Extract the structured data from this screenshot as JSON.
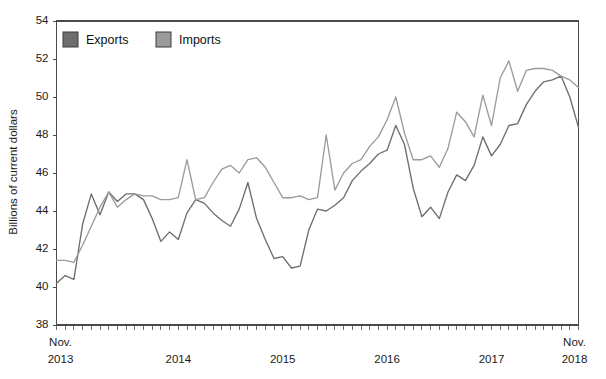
{
  "chart_data": {
    "type": "line",
    "title": "",
    "xlabel": "",
    "ylabel": "Billions of current dollars",
    "ylim": [
      38,
      54
    ],
    "ytick_step": 2,
    "yticks": [
      38,
      40,
      42,
      44,
      46,
      48,
      50,
      52,
      54
    ],
    "grid": false,
    "legend_position": "top-left",
    "x_start_label": "Nov.",
    "x_start_year": "2013",
    "x_end_label": "Nov.",
    "x_end_year": "2018",
    "x_year_labels": [
      "2014",
      "2015",
      "2016",
      "2017"
    ],
    "x_year_positions": [
      14,
      26,
      38,
      50
    ],
    "x_tick_count": 61,
    "x": [
      "Nov. 2013",
      "Dec. 2013",
      "Jan. 2014",
      "Feb. 2014",
      "Mar. 2014",
      "Apr. 2014",
      "May 2014",
      "Jun. 2014",
      "Jul. 2014",
      "Aug. 2014",
      "Sep. 2014",
      "Oct. 2014",
      "Nov. 2014",
      "Dec. 2014",
      "Jan. 2015",
      "Feb. 2015",
      "Mar. 2015",
      "Apr. 2015",
      "May 2015",
      "Jun. 2015",
      "Jul. 2015",
      "Aug. 2015",
      "Sep. 2015",
      "Oct. 2015",
      "Nov. 2015",
      "Dec. 2015",
      "Jan. 2016",
      "Feb. 2016",
      "Mar. 2016",
      "Apr. 2016",
      "May 2016",
      "Jun. 2016",
      "Jul. 2016",
      "Aug. 2016",
      "Sep. 2016",
      "Oct. 2016",
      "Nov. 2016",
      "Dec. 2016",
      "Jan. 2017",
      "Feb. 2017",
      "Mar. 2017",
      "Apr. 2017",
      "May 2017",
      "Jun. 2017",
      "Jul. 2017",
      "Aug. 2017",
      "Sep. 2017",
      "Oct. 2017",
      "Nov. 2017",
      "Dec. 2017",
      "Jan. 2018",
      "Feb. 2018",
      "Mar. 2018",
      "Apr. 2018",
      "May 2018",
      "Jun. 2018",
      "Jul. 2018",
      "Aug. 2018",
      "Sep. 2018",
      "Oct. 2018",
      "Nov. 2018"
    ],
    "series": [
      {
        "name": "Exports",
        "color": "#6e6e6e",
        "legend_swatch_color": "#6e6e6e",
        "values": [
          40.2,
          40.6,
          40.4,
          43.3,
          44.9,
          43.8,
          45.0,
          44.5,
          44.9,
          44.9,
          44.6,
          43.6,
          42.4,
          42.9,
          42.5,
          43.9,
          44.6,
          44.4,
          43.9,
          43.5,
          43.2,
          44.1,
          45.5,
          43.6,
          42.5,
          41.5,
          41.6,
          41.0,
          41.1,
          43.0,
          44.1,
          44.0,
          44.3,
          44.7,
          45.6,
          46.1,
          46.5,
          47.0,
          47.2,
          48.5,
          47.5,
          45.2,
          43.7,
          44.2,
          43.6,
          45.0,
          45.9,
          45.6,
          46.4,
          47.9,
          46.9,
          47.5,
          48.5,
          48.6,
          49.6,
          50.3,
          50.8,
          50.9,
          51.1,
          50.0,
          48.4
        ]
      },
      {
        "name": "Imports",
        "color": "#9b9b9b",
        "legend_swatch_color": "#9b9b9b",
        "values": [
          41.4,
          41.4,
          41.3,
          42.2,
          43.2,
          44.2,
          45.0,
          44.2,
          44.6,
          44.9,
          44.8,
          44.8,
          44.6,
          44.6,
          44.7,
          46.7,
          44.6,
          44.7,
          45.5,
          46.2,
          46.4,
          46.0,
          46.7,
          46.8,
          46.3,
          45.5,
          44.7,
          44.7,
          44.8,
          44.6,
          44.7,
          48.0,
          45.1,
          46.0,
          46.5,
          46.7,
          47.4,
          47.9,
          48.8,
          50.0,
          48.1,
          46.7,
          46.7,
          46.9,
          46.3,
          47.3,
          49.2,
          48.7,
          47.9,
          50.1,
          48.5,
          51.0,
          51.9,
          50.3,
          51.4,
          51.5,
          51.5,
          51.4,
          51.1,
          50.9,
          50.5
        ]
      }
    ]
  },
  "legend": {
    "items": [
      {
        "label": "Exports",
        "color": "#6e6e6e"
      },
      {
        "label": "Imports",
        "color": "#9b9b9b"
      }
    ]
  }
}
